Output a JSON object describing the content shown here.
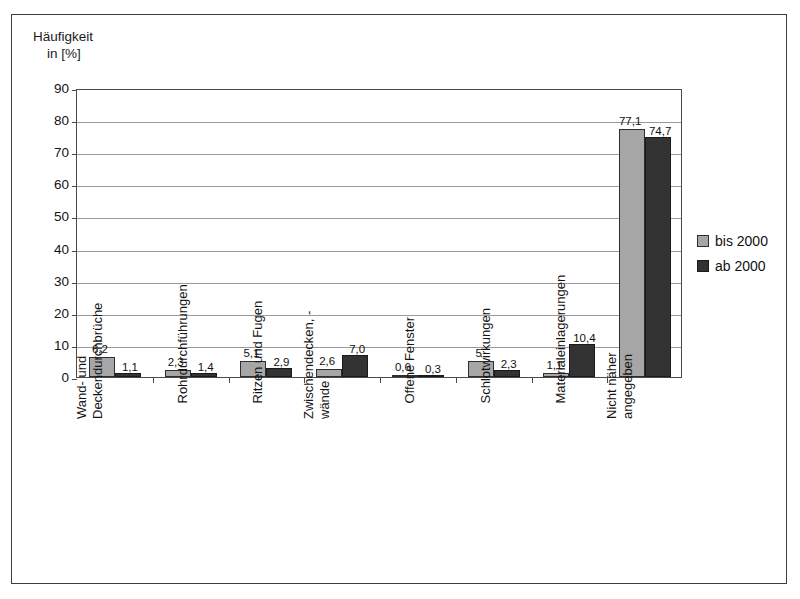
{
  "figure": {
    "axis_title_line1": "Häufigkeit",
    "axis_title_line2": "in [%]"
  },
  "legend": {
    "position": "right",
    "items": [
      {
        "label": "bis 2000",
        "color": "#a6a6a6"
      },
      {
        "label": "ab 2000",
        "color": "#333333"
      }
    ]
  },
  "chart_data": {
    "type": "bar",
    "title": "",
    "subtitle": "",
    "xlabel": "",
    "ylabel": "Häufigkeit in [%]",
    "ylim": [
      0,
      90
    ],
    "yticks": [
      0,
      10,
      20,
      30,
      40,
      50,
      60,
      70,
      80,
      90
    ],
    "ytick_labels": [
      "0",
      "10",
      "20",
      "30",
      "40",
      "50",
      "60",
      "70",
      "80",
      "90"
    ],
    "grid": true,
    "legend_position": "right",
    "categories": [
      "Wand- und Deckendurchbrüche",
      "Rohrdurchführungen",
      "Ritzen und Fugen",
      "Zwischendecken, -wände",
      "Offene Fenster",
      "Schlotwirkungen",
      "Materialeinlagerungen",
      "Nicht näher angegeben"
    ],
    "category_lines": [
      [
        "Wand- und",
        "Deckendurchbrüche"
      ],
      [
        "Rohrdurchführungen",
        ""
      ],
      [
        "Ritzen und Fugen",
        ""
      ],
      [
        "Zwischendecken, -",
        "wände"
      ],
      [
        "Offene Fenster",
        ""
      ],
      [
        "Schlotwirkungen",
        ""
      ],
      [
        "Materialeinlagerungen",
        ""
      ],
      [
        "Nicht näher",
        "angegeben"
      ]
    ],
    "series": [
      {
        "name": "bis 2000",
        "color": "#a6a6a6",
        "values": [
          6.2,
          2.3,
          5.1,
          2.6,
          0.6,
          5.0,
          1.1,
          77.1
        ],
        "labels": [
          "6,2",
          "2,3",
          "5,1",
          "2,6",
          "0,6",
          "5",
          "1,1",
          "77,1"
        ]
      },
      {
        "name": "ab 2000",
        "color": "#333333",
        "values": [
          1.1,
          1.4,
          2.9,
          7.0,
          0.3,
          2.3,
          10.4,
          74.7
        ],
        "labels": [
          "1,1",
          "1,4",
          "2,9",
          "7,0",
          "0,3",
          "2,3",
          "10,4",
          "74,7"
        ]
      }
    ]
  }
}
